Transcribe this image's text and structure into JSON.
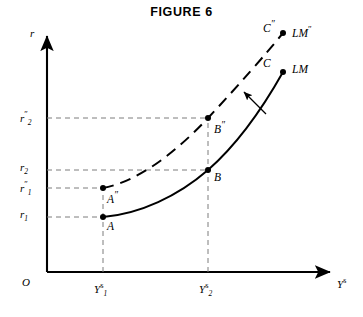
{
  "figure": {
    "title": "FIGURE 6",
    "origin_label": "O"
  },
  "axes": {
    "y_axis_name": "r",
    "x_axis_name_base": "Y",
    "x_axis_name_sup": "s",
    "y_ticks": [
      {
        "base": "r",
        "sub": "2",
        "sup": "″",
        "value_y": 118
      },
      {
        "base": "r",
        "sub": "2",
        "sup": "",
        "value_y": 170
      },
      {
        "base": "r",
        "sub": "1",
        "sup": "″",
        "value_y": 188
      },
      {
        "base": "r",
        "sub": "1",
        "sup": "",
        "value_y": 217
      }
    ],
    "x_ticks": [
      {
        "base": "Y",
        "sub": "1",
        "sup": "s",
        "value_x": 103
      },
      {
        "base": "Y",
        "sub": "2",
        "sup": "s",
        "value_x": 208
      }
    ]
  },
  "points": [
    {
      "name": "A",
      "label": "A",
      "sup": "",
      "x": 103,
      "y": 217
    },
    {
      "name": "A2",
      "label": "A",
      "sup": "″",
      "x": 103,
      "y": 188
    },
    {
      "name": "B",
      "label": "B",
      "sup": "",
      "x": 208,
      "y": 170
    },
    {
      "name": "B2",
      "label": "B",
      "sup": "″",
      "x": 208,
      "y": 118
    },
    {
      "name": "C",
      "label": "C",
      "sup": "",
      "x": 283,
      "y": 72
    },
    {
      "name": "C2",
      "label": "C",
      "sup": "″",
      "x": 283,
      "y": 33
    }
  ],
  "curves": [
    {
      "name": "LM",
      "label_base": "LM",
      "label_sup": "",
      "style": "solid",
      "path": "M 103 217 C 140 214, 178 196, 208 170 C 240 142, 265 104, 283 72"
    },
    {
      "name": "LM-shifted",
      "label_base": "LM",
      "label_sup": "″",
      "style": "dashed",
      "path": "M 103 188 C 140 181, 178 150, 208 118 C 238 86, 266 54, 283 33"
    }
  ],
  "shift_arrow": {
    "name": "shift-arrow",
    "path": "M 266 114 L 244 92"
  },
  "colors": {
    "ink": "#000000",
    "guide": "#8a8a8a"
  }
}
